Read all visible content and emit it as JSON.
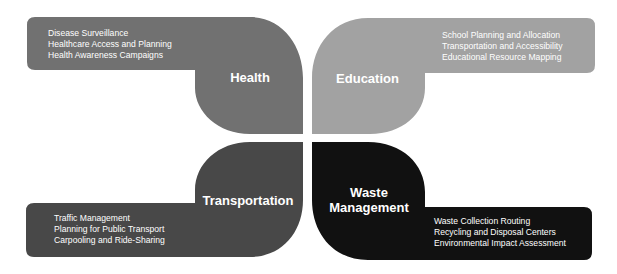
{
  "colors": {
    "health": "#717171",
    "education": "#a2a2a2",
    "transportation": "#484848",
    "waste_management": "#111111",
    "background": "#ffffff"
  },
  "quadrants": {
    "health": {
      "title": "Health",
      "items": [
        "Disease Surveillance",
        "Healthcare Access and Planning",
        "Health Awareness Campaigns"
      ]
    },
    "education": {
      "title": "Education",
      "items": [
        "School Planning and Allocation",
        "Transportation and Accessibility",
        "Educational Resource Mapping"
      ]
    },
    "transportation": {
      "title": "Transportation",
      "items": [
        "Traffic Management",
        "Planning for Public Transport",
        "Carpooling and Ride-Sharing"
      ]
    },
    "waste_management": {
      "title_line1": "Waste",
      "title_line2": "Management",
      "items": [
        "Waste Collection Routing",
        "Recycling and Disposal Centers",
        "Environmental Impact Assessment"
      ]
    }
  }
}
